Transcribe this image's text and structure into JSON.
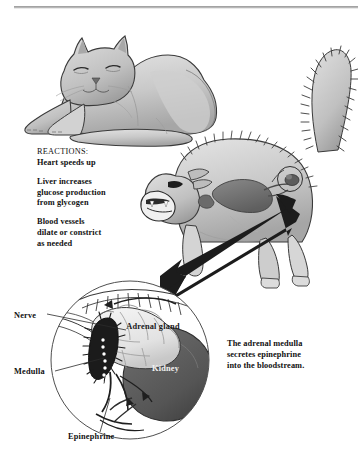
{
  "page": {
    "background_color": "#ffffff",
    "rule_color": "#8d8d8d"
  },
  "illustration": {
    "title": "Fight-or-flight response in a cat with adrenal gland detail",
    "figures": [
      {
        "name": "resting-cat",
        "description": "Relaxed cat lying down, grey tonal drawing"
      },
      {
        "name": "aroused-cat",
        "description": "Arched back hissing cat with raised bristled tail, internal organs visible"
      },
      {
        "name": "detail-circle",
        "description": "Circular magnified inset of adrenal gland, medulla and kidney"
      }
    ],
    "colors": {
      "fur_light": "#d9d9d9",
      "fur_mid": "#b9b9b9",
      "fur_shadow": "#8f8f8f",
      "outline": "#2b2b2b",
      "organ_dark": "#6a6a6a",
      "kidney": "#585858",
      "adrenal": "#ededed",
      "medulla": "#1d1d1d",
      "arrow": "#1a1a1a",
      "epinephrine_dot": "#ffffff"
    }
  },
  "reactions": {
    "heading": "REACTIONS:",
    "items": [
      "Heart speeds up",
      "Liver increases\nglucose production\nfrom glycogen",
      "Blood vessels\ndilate or constrict\nas needed"
    ],
    "item_1": "Heart speeds up",
    "item_2_line_1": "Liver increases",
    "item_2_line_2": "glucose production",
    "item_2_line_3": "from glycogen",
    "item_3_line_1": "Blood vessels",
    "item_3_line_2": "dilate or constrict",
    "item_3_line_3": "as needed"
  },
  "caption": {
    "line_1": "The adrenal medulla",
    "line_2": "secretes epinephrine",
    "line_3": "into the bloodstream."
  },
  "labels": {
    "nerve": "Nerve",
    "medulla": "Medulla",
    "epinephrine": "Epinephrine",
    "adrenal_gland": "Adrenal gland",
    "kidney": "Kidney"
  }
}
